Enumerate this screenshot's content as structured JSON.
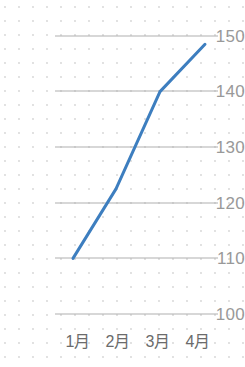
{
  "chart_data": {
    "type": "line",
    "title": "",
    "subtitle": "",
    "xlabel": "",
    "ylabel": "",
    "categories": [
      "1月",
      "2月",
      "3月",
      "4月"
    ],
    "series": [
      {
        "name": "",
        "values": [
          110,
          122.5,
          140,
          148.5
        ],
        "color": "#3d7ebf"
      }
    ],
    "ylim": [
      100,
      150
    ],
    "yticks": [
      100,
      110,
      120,
      130,
      140,
      150
    ],
    "ytick_labels": [
      "100",
      "110",
      "120",
      "130",
      "140",
      "150"
    ],
    "xtick_labels": [
      "1月",
      "2月",
      "3月",
      "4月"
    ],
    "grid": true,
    "grid_axis": "y",
    "grid_color": "#b0b0b0",
    "legend": false,
    "legend_position": "none",
    "markers": false,
    "background": "#ffffff",
    "dot_grid_background": true
  },
  "axes": {
    "y": {
      "ticks": [
        {
          "label": "150",
          "value": 150
        },
        {
          "label": "140",
          "value": 140
        },
        {
          "label": "130",
          "value": 130
        },
        {
          "label": "120",
          "value": 120
        },
        {
          "label": "110",
          "value": 110
        },
        {
          "label": "100",
          "value": 100
        }
      ]
    },
    "x": {
      "ticks": [
        {
          "label": "1月"
        },
        {
          "label": "2月"
        },
        {
          "label": "3月"
        },
        {
          "label": "4月"
        }
      ]
    }
  },
  "colors": {
    "line": "#3d7ebf",
    "gridline": "#b0b0b0",
    "ytick_text": "#999999",
    "xtick_text": "#6b6b6b",
    "page_background": "#ffffff"
  }
}
